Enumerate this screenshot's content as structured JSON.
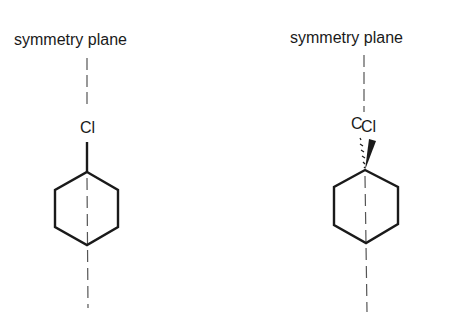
{
  "diagram": {
    "left_molecule": {
      "plane_label": "symmetry plane",
      "substituent": "Cl"
    },
    "right_molecule": {
      "plane_label": "symmetry plane",
      "substituent_back": "C",
      "substituent_front": "Cl"
    },
    "colors": {
      "line": "#1a1a1a",
      "plane": "#555555"
    }
  }
}
